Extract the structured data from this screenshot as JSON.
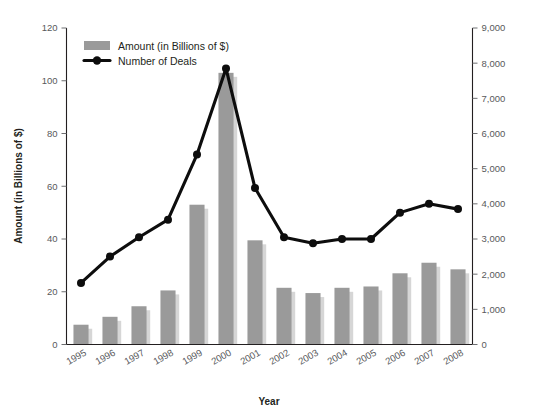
{
  "chart_data": {
    "type": "bar",
    "title": "",
    "subtitle": "",
    "xlabel": "Year",
    "ylabel": "Amount (in Billions of $)",
    "y2label": "",
    "categories": [
      "1995",
      "1996",
      "1997",
      "1998",
      "1999",
      "2000",
      "2001",
      "2002",
      "2003",
      "2004",
      "2005",
      "2006",
      "2007",
      "2008"
    ],
    "ylim": [
      0,
      120
    ],
    "y2lim": [
      0,
      9000
    ],
    "yticks": [
      "0",
      "20",
      "40",
      "60",
      "80",
      "100",
      "120"
    ],
    "y2ticks": [
      "0",
      "1,000",
      "2,000",
      "3,000",
      "4,000",
      "5,000",
      "6,000",
      "7,000",
      "8,000",
      "9,000"
    ],
    "grid": false,
    "legend_position": "top-left",
    "series": [
      {
        "name": "Amount (in Billions of $)",
        "type": "bar",
        "axis": "left",
        "color": "#9a9a9a",
        "values": [
          7.5,
          10.5,
          14.5,
          20.5,
          53.0,
          103.0,
          39.5,
          21.5,
          19.5,
          21.5,
          22.0,
          27.0,
          31.0,
          28.5
        ]
      },
      {
        "name": "Number of Deals",
        "type": "line",
        "axis": "right",
        "color": "#0d0d0d",
        "values": [
          1750,
          2500,
          3050,
          3550,
          5400,
          7850,
          4450,
          3050,
          2880,
          3000,
          3000,
          3750,
          4000,
          3850
        ]
      }
    ]
  },
  "legend": {
    "items": [
      {
        "label": "Amount (in Billions of $)",
        "marker": "swatch",
        "color": "#9a9a9a"
      },
      {
        "label": "Number of Deals",
        "marker": "line-dot",
        "color": "#0d0d0d"
      }
    ]
  },
  "axes": {
    "left_title": "Amount (in Billions of $)",
    "bottom_title": "Year"
  }
}
